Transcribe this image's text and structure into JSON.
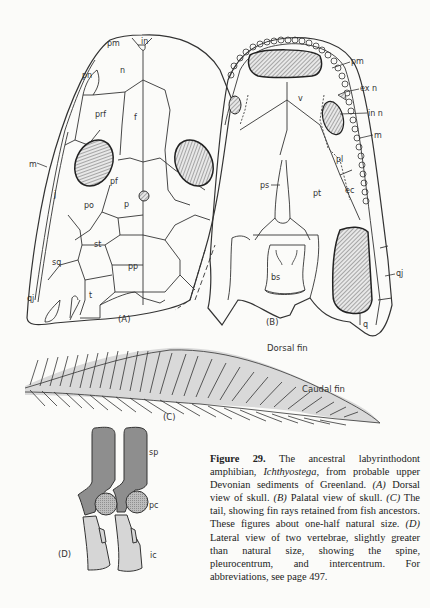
{
  "figure": {
    "number": "Figure 29.",
    "caption": {
      "intro": "The ancestral labyrinthodont amphibian,",
      "genus": "Ichthyostega,",
      "rest1": "from probable upper Devonian sediments of Greenland.",
      "a_tag": "(A)",
      "a_text": "Dorsal view of skull.",
      "b_tag": "(B)",
      "b_text": "Palatal view of skull.",
      "c_tag": "(C)",
      "c_text": "The tail, showing fin rays retained from fish ancestors. These figures about one-half natural size.",
      "d_tag": "(D)",
      "d_text": "Lateral view of two vertebrae, slightly greater than natural size, showing the spine, pleurocentrum, and intercentrum. For abbreviations, see page 497."
    }
  },
  "panel_a": {
    "label": "(A)",
    "bones": [
      "pm",
      "in",
      "pn",
      "n",
      "prf",
      "f",
      "m",
      "pf",
      "j",
      "po",
      "p",
      "st",
      "sq",
      "pp",
      "qj",
      "t"
    ]
  },
  "panel_b": {
    "label": "(B)",
    "bones": [
      "pm",
      "ex n",
      "in n",
      "m",
      "v",
      "pl",
      "ps",
      "pt",
      "ec",
      "bs",
      "qj",
      "q"
    ]
  },
  "panel_c": {
    "label": "(C)",
    "annotations": [
      "Dorsal fin",
      "Caudal fin"
    ]
  },
  "panel_d": {
    "label": "(D)",
    "parts": [
      "sp",
      "pc",
      "ic"
    ]
  }
}
